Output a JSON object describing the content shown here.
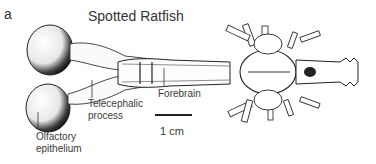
{
  "figure": {
    "panel_label": "a",
    "title": "Spotted Ratfish",
    "labels": {
      "olfactory_epithelium_line1": "Olfactory",
      "olfactory_epithelium_line2": "epithelium",
      "telecephalic_line1": "Telecephalic",
      "telecephalic_line2": "process",
      "forebrain": "Forebrain"
    },
    "scale_bar": {
      "label": "1 cm"
    }
  }
}
